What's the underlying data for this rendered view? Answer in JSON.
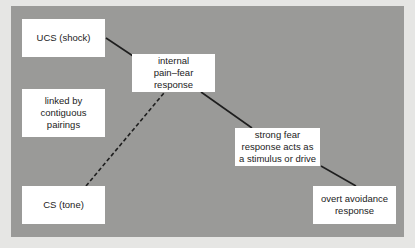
{
  "diagram": {
    "colors": {
      "background": "#e6e6e4",
      "panel": "#9a9a98",
      "box": "#ffffff",
      "line": "#1e1e1e",
      "text": "#222222"
    },
    "nodes": {
      "ucs": {
        "label": "UCS (shock)"
      },
      "pain_fear": {
        "label": "internal pain–fear response"
      },
      "linked": {
        "label": "linked by contiguous pairings"
      },
      "strong_fear": {
        "label": "strong fear response acts as a stimulus or drive"
      },
      "cs": {
        "label": "CS (tone)"
      },
      "avoidance": {
        "label": "overt avoidance response"
      }
    },
    "edges": [
      {
        "from": "ucs",
        "to": "pain_fear",
        "style": "solid"
      },
      {
        "from": "cs",
        "to": "pain_fear",
        "style": "dashed"
      },
      {
        "from": "pain_fear",
        "to": "strong_fear",
        "style": "solid"
      },
      {
        "from": "strong_fear",
        "to": "avoidance",
        "style": "solid"
      }
    ]
  }
}
